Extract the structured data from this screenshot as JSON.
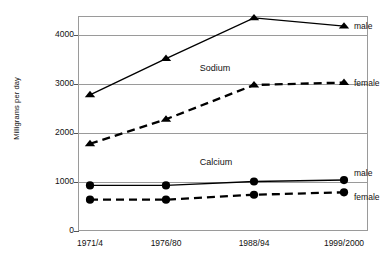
{
  "chart_data": {
    "type": "line",
    "title": "",
    "xlabel": "",
    "ylabel": "Milligrams per day",
    "categories": [
      "1971/4",
      "1976/80",
      "1988/94",
      "1999/2000"
    ],
    "ylim": [
      0,
      4400
    ],
    "yticks": [
      0,
      1000,
      2000,
      3000,
      4000
    ],
    "ytick_labels": [
      "0",
      "1000",
      "2000",
      "3000",
      "4000"
    ],
    "grid": "horizontal",
    "legend": "inline-right",
    "series": [
      {
        "name": "Sodium male",
        "group": "Sodium",
        "sex": "male",
        "marker": "triangle",
        "line": "solid",
        "values": [
          2780,
          3520,
          4350,
          4180
        ],
        "end_label": "male"
      },
      {
        "name": "Sodium female",
        "group": "Sodium",
        "sex": "female",
        "marker": "triangle",
        "line": "dashed",
        "values": [
          1780,
          2280,
          2980,
          3030
        ],
        "end_label": "female"
      },
      {
        "name": "Calcium male",
        "group": "Calcium",
        "sex": "male",
        "marker": "circle",
        "line": "solid",
        "values": [
          930,
          930,
          1010,
          1040
        ],
        "end_label": "male"
      },
      {
        "name": "Calcium female",
        "group": "Calcium",
        "sex": "female",
        "marker": "circle",
        "line": "dashed",
        "values": [
          640,
          640,
          740,
          790
        ],
        "end_label": "female"
      }
    ],
    "annotations": [
      {
        "text": "Sodium",
        "x_frac": 0.42,
        "y_value": 3300
      },
      {
        "text": "Calcium",
        "x_frac": 0.42,
        "y_value": 1380
      }
    ],
    "colors": {
      "line": "#000000",
      "grid": "#9a9a9a",
      "text": "#111111",
      "background": "#ffffff"
    }
  }
}
